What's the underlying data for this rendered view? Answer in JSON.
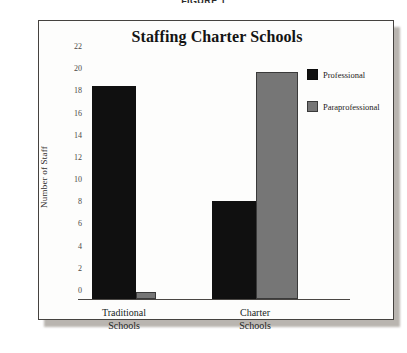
{
  "figure": {
    "caption": "FIGURE 1"
  },
  "chart_data": {
    "type": "bar",
    "title": "Staffing Charter Schools",
    "xlabel": "",
    "ylabel": "Number of Staff",
    "categories": [
      "Traditional Schools",
      "Charter Schools"
    ],
    "category_lines": [
      [
        "Traditional",
        "Schools"
      ],
      [
        "Charter",
        "Schools"
      ]
    ],
    "series": [
      {
        "name": "Professional",
        "color": "#101010",
        "values": [
          19.2,
          8.8
        ]
      },
      {
        "name": "Paraprofessional",
        "color": "#767676",
        "values": [
          0.6,
          20.5
        ]
      }
    ],
    "ylim": [
      0,
      22
    ],
    "ytick_step": 2,
    "ytick_labels": [
      "22",
      "20",
      "18",
      "16",
      "14",
      "12",
      "10",
      "8",
      "6",
      "4",
      "2",
      "0"
    ],
    "grid": false,
    "legend_position": "right"
  }
}
